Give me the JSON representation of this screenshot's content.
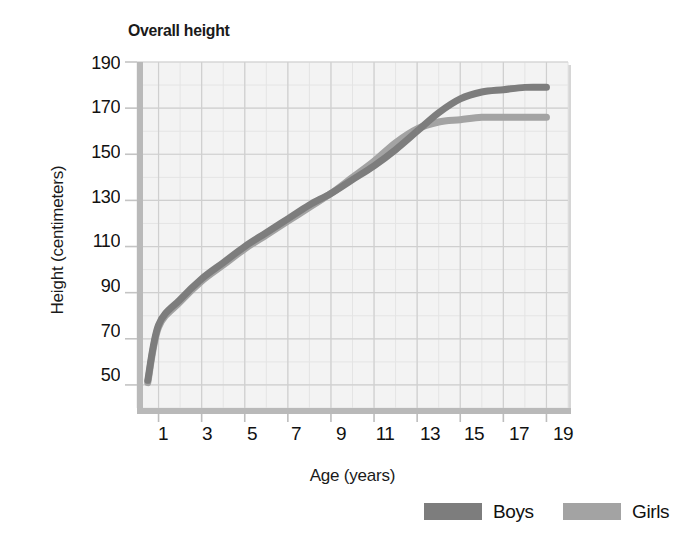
{
  "chart_data": {
    "type": "line",
    "title": "Overall height",
    "xlabel": "Age (years)",
    "ylabel": "Height (centimeters)",
    "xlim": [
      0,
      20
    ],
    "ylim": [
      40,
      190
    ],
    "xticks": [
      1,
      3,
      5,
      7,
      9,
      11,
      13,
      15,
      17,
      19
    ],
    "yticks": [
      50,
      70,
      90,
      110,
      130,
      150,
      170,
      190
    ],
    "grid": true,
    "legend_position": "bottom-right",
    "x": [
      0.5,
      1,
      2,
      3,
      4,
      5,
      6,
      7,
      8,
      9,
      10,
      11,
      12,
      13,
      14,
      15,
      16,
      17,
      18,
      19
    ],
    "series": [
      {
        "name": "Boys",
        "color": "#7d7d7d",
        "values": [
          52,
          76,
          87,
          96,
          103,
          110,
          116,
          122,
          128,
          133,
          139,
          145,
          152,
          160,
          168,
          174,
          177,
          178,
          179,
          179
        ]
      },
      {
        "name": "Girls",
        "color": "#a3a3a3",
        "values": [
          51,
          75,
          86,
          95,
          102,
          109,
          115,
          121,
          127,
          133,
          140,
          147,
          155,
          161,
          164,
          165,
          166,
          166,
          166,
          166
        ]
      }
    ]
  },
  "legend": {
    "items": [
      {
        "label": "Boys",
        "color": "#7d7d7d"
      },
      {
        "label": "Girls",
        "color": "#a3a3a3"
      }
    ]
  },
  "axes": {
    "y_tick_labels": [
      "190",
      "170",
      "150",
      "130",
      "110",
      "90",
      "70",
      "50"
    ],
    "x_tick_labels": [
      "1",
      "3",
      "5",
      "7",
      "9",
      "11",
      "13",
      "15",
      "17",
      "19"
    ]
  }
}
